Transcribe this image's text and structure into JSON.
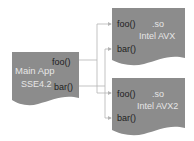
{
  "colors": {
    "document_fill": "#8c8c8c",
    "connector": "#b4b4b4",
    "label_dark": "#1e1e1e",
    "label_light": "#e6e6e6",
    "background": "#ffffff"
  },
  "main_app": {
    "title": "Main App",
    "subtitle": "SSE4.2",
    "functions": [
      "foo()",
      "bar()"
    ]
  },
  "libraries": [
    {
      "ext": ".so",
      "name": "Intel AVX",
      "functions": [
        "foo()",
        "bar()"
      ]
    },
    {
      "ext": ".so",
      "name": "Intel AVX2",
      "functions": [
        "foo()",
        "bar()"
      ]
    }
  ]
}
